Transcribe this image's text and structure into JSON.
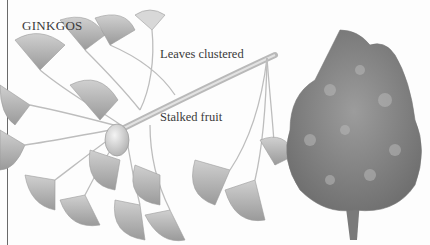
{
  "figure": {
    "title": "GINKGOS",
    "labels": {
      "leaves": "Leaves clustered",
      "fruit": "Stalked fruit"
    },
    "illustrations": [
      "ginkgo-branch-with-leaves-and-fruit",
      "ginkgo-tree"
    ],
    "colors": {
      "ink": "#3a3a3a",
      "leaf": "#b5b5b5",
      "leaf_dark": "#8f8f8f",
      "branch": "#c8c8c8",
      "tree": "#8a8a8a",
      "rule": "#6a6a6a"
    }
  }
}
